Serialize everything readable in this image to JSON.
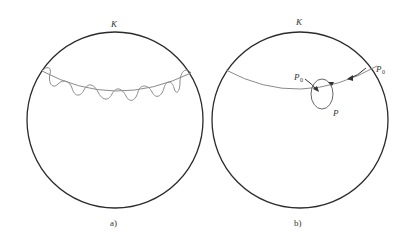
{
  "figure": {
    "panels": [
      {
        "id": "a",
        "caption": "a)",
        "sphere_label": "K",
        "description": "Circle K with a great-circle arc crossed by a sinusoidal oscillating path"
      },
      {
        "id": "b",
        "caption": "b)",
        "sphere_label": "K",
        "point_start_label": "P",
        "point_start_sub": "0",
        "point_loop_start_label": "P",
        "point_loop_start_sub": "0",
        "point_label": "P",
        "description": "Circle K with arc, arrow from P0 along arc, small loop through P"
      }
    ],
    "colors": {
      "circle": "#2b2b2b",
      "curve": "#8a8a8a",
      "text": "#333333"
    }
  }
}
